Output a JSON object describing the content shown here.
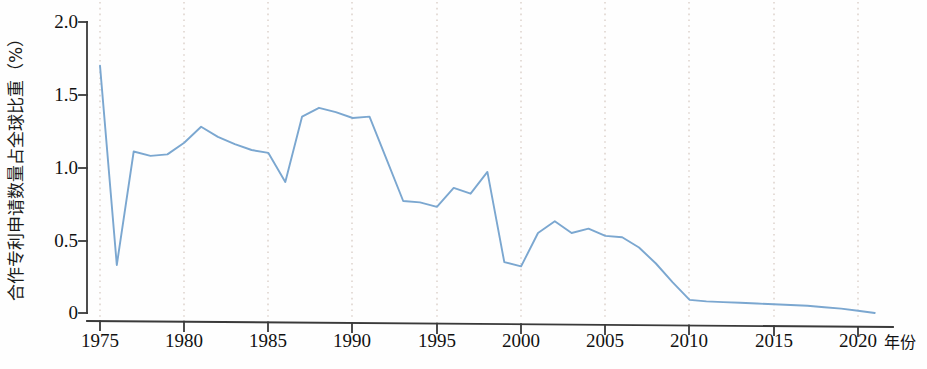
{
  "chart_data": {
    "type": "line",
    "title": "",
    "xlabel": "年份",
    "ylabel": "合作专利申请数量占全球比重（%）",
    "xlim": [
      1974.2,
      1922
    ],
    "ylim": [
      0,
      2.0
    ],
    "grid": "vertical-dotted",
    "legend": "none",
    "line_color": "#7BA7D0",
    "axis_color": "#3a3a3a",
    "gridline_color": "#d9cfc9",
    "y_ticks": [
      "0",
      "0.5",
      "1.0",
      "1.5",
      "2.0"
    ],
    "y_tick_values": [
      0,
      0.5,
      1.0,
      1.5,
      2.0
    ],
    "x_ticks": [
      "1975",
      "1980",
      "1985",
      "1990",
      "1995",
      "2000",
      "2005",
      "2010",
      "2015",
      "2020"
    ],
    "x_tick_values": [
      1975,
      1980,
      1985,
      1990,
      1995,
      2000,
      2005,
      2010,
      2015,
      2020
    ],
    "x": [
      1975,
      1976,
      1977,
      1978,
      1979,
      1980,
      1981,
      1982,
      1983,
      1984,
      1985,
      1986,
      1987,
      1988,
      1989,
      1990,
      1991,
      1992,
      1993,
      1994,
      1995,
      1996,
      1997,
      1998,
      1999,
      2000,
      2001,
      2002,
      2003,
      2004,
      2005,
      2006,
      2007,
      2008,
      2009,
      2010,
      2011,
      2012,
      2013,
      2014,
      2015,
      2016,
      2017,
      2018,
      2019,
      2020,
      2021
    ],
    "values": [
      1.7,
      0.33,
      1.11,
      1.08,
      1.09,
      1.17,
      1.28,
      1.21,
      1.16,
      1.12,
      1.1,
      0.9,
      1.35,
      1.41,
      1.38,
      1.34,
      1.35,
      1.06,
      0.77,
      0.76,
      0.73,
      0.86,
      0.82,
      0.97,
      0.35,
      0.32,
      0.55,
      0.63,
      0.55,
      0.58,
      0.53,
      0.52,
      0.45,
      0.34,
      0.21,
      0.09,
      0.08,
      0.075,
      0.07,
      0.065,
      0.06,
      0.055,
      0.05,
      0.04,
      0.03,
      0.015,
      0.0
    ]
  },
  "axes": {
    "y_title": "合作专利申请数量占全球比重（%）",
    "x_unit": "年份"
  }
}
